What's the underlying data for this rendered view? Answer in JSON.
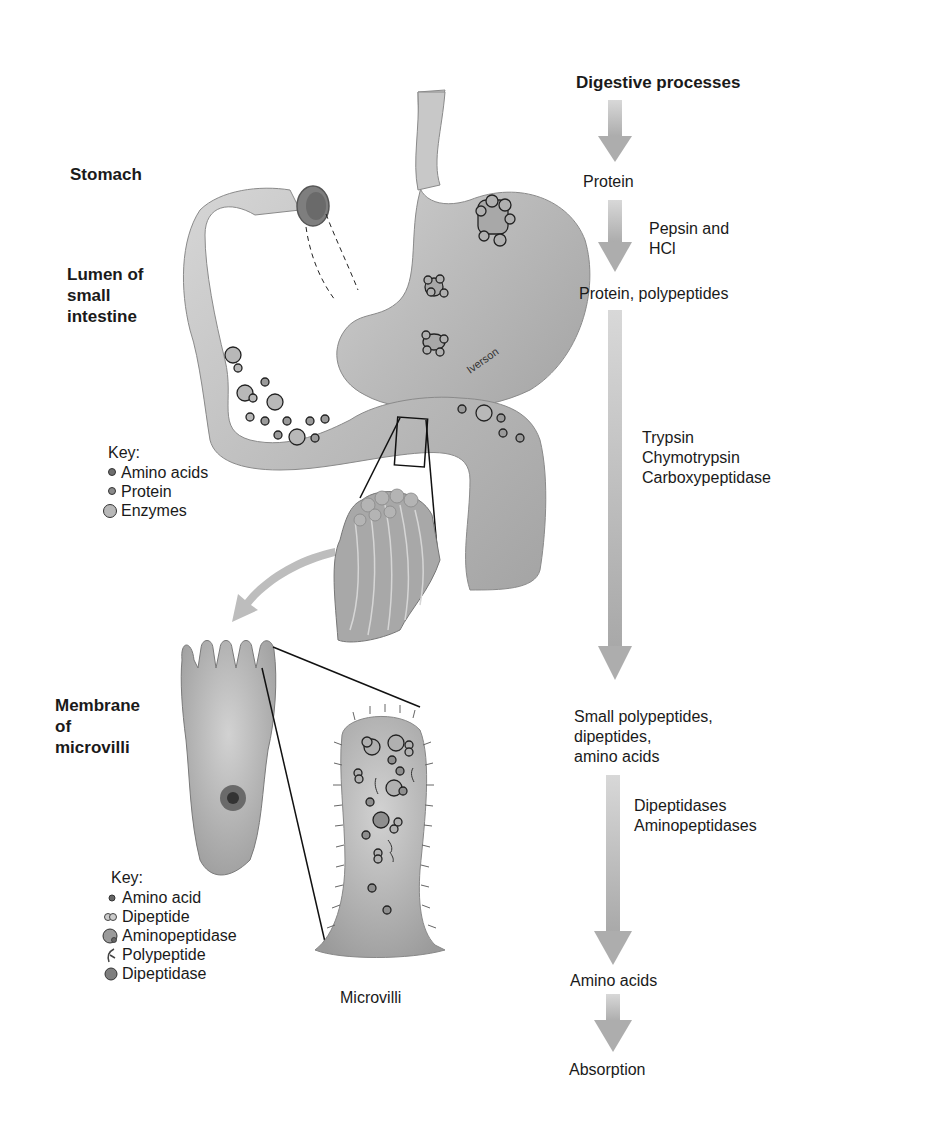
{
  "diagram": {
    "title": "Digestive processes",
    "illustrator_signature": "Iverson",
    "region_labels": {
      "stomach": "Stomach",
      "lumen": [
        "Lumen of",
        "small",
        "intestine"
      ],
      "membrane": [
        "Membrane",
        "of",
        "microvilli"
      ],
      "microvilli": "Microvilli"
    },
    "lumen_key": {
      "title": "Key:",
      "items": [
        {
          "label": "Amino acids",
          "icon": "small-dark-circle"
        },
        {
          "label": "Protein",
          "icon": "small-dark-circle"
        },
        {
          "label": "Enzymes",
          "icon": "large-light-circle"
        }
      ]
    },
    "membrane_key": {
      "title": "Key:",
      "items": [
        {
          "label": "Amino acid",
          "icon": "small-dark-circle"
        },
        {
          "label": "Dipeptide",
          "icon": "double-circle"
        },
        {
          "label": "Aminopeptidase",
          "icon": "large-circle-notch"
        },
        {
          "label": "Polypeptide",
          "icon": "hook-strand"
        },
        {
          "label": "Dipeptidase",
          "icon": "large-dark-circle"
        }
      ]
    },
    "process_flow": {
      "steps": [
        {
          "substrate": [
            "Protein"
          ],
          "enzymes": [
            "Pepsin and",
            "HCl"
          ]
        },
        {
          "substrate": [
            "Protein, polypeptides"
          ],
          "enzymes": [
            "Trypsin",
            "Chymotrypsin",
            "Carboxypeptidase"
          ]
        },
        {
          "substrate": [
            "Small polypeptides,",
            "dipeptides,",
            "amino acids"
          ],
          "enzymes": [
            "Dipeptidases",
            "Aminopeptidases"
          ]
        },
        {
          "substrate": [
            "Amino acids"
          ],
          "enzymes": []
        },
        {
          "substrate": [
            "Absorption"
          ],
          "enzymes": []
        }
      ]
    },
    "colors": {
      "arrow": "#b4b4b4",
      "organ_fill": "#bdbdbd",
      "organ_dark": "#8e8e8e",
      "text": "#1a1a1a"
    }
  }
}
